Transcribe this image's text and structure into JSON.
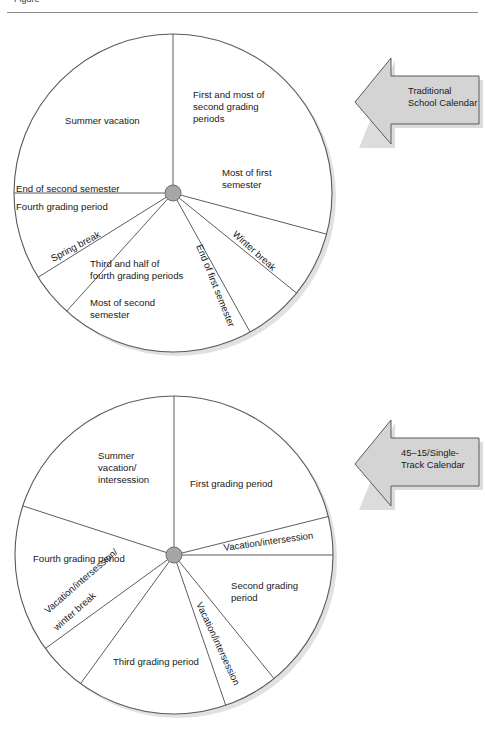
{
  "page": {
    "background": "#ffffff",
    "cropped_caption_fragment": "Figure"
  },
  "style": {
    "circle_stroke": "#5a5a5a",
    "divider_stroke": "#4a4a4a",
    "hub_fill": "#a6a6a6",
    "hub_stroke": "#6e6e6e",
    "arrow_fill": "#d4d4d4",
    "arrow_stroke": "#5a5a5a",
    "shadow": "#c9c9c9",
    "text_color": "#1a1a1a"
  },
  "figures": [
    {
      "id": "traditional-calendar",
      "callout": {
        "label": "Traditional\nSchool Calendar"
      },
      "chart_data": {
        "type": "pie",
        "title": "Traditional School Calendar",
        "center": {
          "x": 173,
          "y": 173
        },
        "radius": 159,
        "note": "Angles measured clockwise from 12 o'clock (0 degrees).",
        "segments": [
          {
            "label": "First and most of\nsecond grading\nperiods",
            "start_angle": 0,
            "end_angle": 105,
            "sweep": 105,
            "group": "instruction"
          },
          {
            "label": "Most of first\nsemester",
            "start_angle": 0,
            "end_angle": 105,
            "sweep": 105,
            "group": "semester-annotation"
          },
          {
            "label": "Winter break",
            "start_angle": 105,
            "end_angle": 129,
            "sweep": 24,
            "group": "break"
          },
          {
            "label": "End of first semester",
            "start_angle": 129,
            "end_angle": 151,
            "sweep": 22,
            "group": "instruction"
          },
          {
            "label": "Third and half of\nfourth grading periods",
            "start_angle": 151,
            "end_angle": 222,
            "sweep": 71,
            "group": "instruction"
          },
          {
            "label": "Most of second\nsemester",
            "start_angle": 151,
            "end_angle": 222,
            "sweep": 71,
            "group": "semester-annotation"
          },
          {
            "label": "Spring break",
            "start_angle": 222,
            "end_angle": 238,
            "sweep": 16,
            "group": "break"
          },
          {
            "label": "End of second semester",
            "start_angle": 238,
            "end_angle": 270,
            "sweep": 32,
            "group": "instruction"
          },
          {
            "label": "Fourth grading period",
            "start_angle": 238,
            "end_angle": 270,
            "sweep": 32,
            "group": "instruction-annotation"
          },
          {
            "label": "Summer vacation",
            "start_angle": 270,
            "end_angle": 360,
            "sweep": 90,
            "group": "vacation"
          }
        ],
        "labels": [
          {
            "text": "First and most of",
            "x": 193,
            "y": 78,
            "rotation": 0,
            "anchor": "start"
          },
          {
            "text": "second grading",
            "x": 193,
            "y": 90,
            "rotation": 0,
            "anchor": "start"
          },
          {
            "text": "periods",
            "x": 193,
            "y": 102,
            "rotation": 0,
            "anchor": "start"
          },
          {
            "text": "Most of first",
            "x": 222,
            "y": 156,
            "rotation": 0,
            "anchor": "start"
          },
          {
            "text": "semester",
            "x": 222,
            "y": 168,
            "rotation": 0,
            "anchor": "start"
          },
          {
            "text": "Summer vacation",
            "x": 65,
            "y": 104,
            "rotation": 0,
            "anchor": "start"
          },
          {
            "text": "End of second semester",
            "x": 16,
            "y": 172,
            "rotation": 0,
            "anchor": "start"
          },
          {
            "text": "Fourth grading period",
            "x": 16,
            "y": 190,
            "rotation": 0,
            "anchor": "start"
          },
          {
            "text": "Spring break",
            "x": 53,
            "y": 242,
            "rotation": -28,
            "anchor": "start"
          },
          {
            "text": "Third and half of",
            "x": 90,
            "y": 247,
            "rotation": 0,
            "anchor": "start"
          },
          {
            "text": "fourth grading periods",
            "x": 90,
            "y": 259,
            "rotation": 0,
            "anchor": "start"
          },
          {
            "text": "Most of second",
            "x": 90,
            "y": 286,
            "rotation": 0,
            "anchor": "start"
          },
          {
            "text": "semester",
            "x": 90,
            "y": 298,
            "rotation": 0,
            "anchor": "start"
          },
          {
            "text": "End of first semester",
            "x": 196,
            "y": 226,
            "rotation": 68,
            "anchor": "start"
          },
          {
            "text": "Winter break",
            "x": 232,
            "y": 215,
            "rotation": 42,
            "anchor": "start"
          }
        ]
      }
    },
    {
      "id": "single-track-calendar",
      "callout": {
        "label": "45–15/Single-\nTrack Calendar"
      },
      "chart_data": {
        "type": "pie",
        "title": "45–15/Single-Track Calendar",
        "center": {
          "x": 174,
          "y": 173
        },
        "radius": 159,
        "note": "Angles measured clockwise from 12 o'clock (0 degrees).",
        "segments": [
          {
            "label": "First grading period",
            "start_angle": 0,
            "end_angle": 76,
            "sweep": 76,
            "group": "instruction"
          },
          {
            "label": "Vacation/intersession",
            "start_angle": 76,
            "end_angle": 90,
            "sweep": 14,
            "group": "break"
          },
          {
            "label": "Second grading\nperiod",
            "start_angle": 90,
            "end_angle": 141,
            "sweep": 51,
            "group": "instruction"
          },
          {
            "label": "Vacation/intersession",
            "start_angle": 141,
            "end_angle": 161,
            "sweep": 20,
            "group": "break"
          },
          {
            "label": "Third grading period",
            "start_angle": 161,
            "end_angle": 216,
            "sweep": 55,
            "group": "instruction"
          },
          {
            "label": "Vacation/intersession/\nwinter break",
            "start_angle": 216,
            "end_angle": 234,
            "sweep": 18,
            "group": "break"
          },
          {
            "label": "Fourth grading period",
            "start_angle": 234,
            "end_angle": 288,
            "sweep": 54,
            "group": "instruction"
          },
          {
            "label": "Summer\nvacation/\nintersession",
            "start_angle": 288,
            "end_angle": 360,
            "sweep": 72,
            "group": "vacation"
          }
        ],
        "labels": [
          {
            "text": "Summer",
            "x": 98,
            "y": 77,
            "rotation": 0,
            "anchor": "start"
          },
          {
            "text": "vacation/",
            "x": 98,
            "y": 89,
            "rotation": 0,
            "anchor": "start"
          },
          {
            "text": "intersession",
            "x": 98,
            "y": 101,
            "rotation": 0,
            "anchor": "start"
          },
          {
            "text": "First grading period",
            "x": 190,
            "y": 105,
            "rotation": 0,
            "anchor": "start"
          },
          {
            "text": "Vacation/intersession",
            "x": 224,
            "y": 169,
            "rotation": -8,
            "anchor": "start"
          },
          {
            "text": "Second grading",
            "x": 231,
            "y": 207,
            "rotation": 0,
            "anchor": "start"
          },
          {
            "text": "period",
            "x": 231,
            "y": 219,
            "rotation": 0,
            "anchor": "start"
          },
          {
            "text": "Fourth grading period",
            "x": 33,
            "y": 180,
            "rotation": 0,
            "anchor": "start"
          },
          {
            "text": "Vacation/intersession/",
            "x": 48,
            "y": 232,
            "rotation": -41,
            "anchor": "start"
          },
          {
            "text": "winter break",
            "x": 57,
            "y": 249,
            "rotation": -41,
            "anchor": "start"
          },
          {
            "text": "Third grading period",
            "x": 113,
            "y": 283,
            "rotation": 0,
            "anchor": "start"
          },
          {
            "text": "Vacation/intersession",
            "x": 196,
            "y": 222,
            "rotation": 65,
            "anchor": "start"
          }
        ]
      }
    }
  ]
}
